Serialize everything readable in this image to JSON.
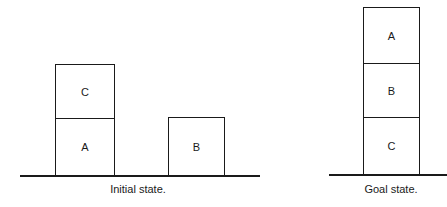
{
  "initial_state": {
    "caption": "Initial state.",
    "blocks": [
      {
        "label": "C",
        "position": "on A"
      },
      {
        "label": "A",
        "position": "on table"
      },
      {
        "label": "B",
        "position": "on table"
      }
    ]
  },
  "goal_state": {
    "caption": "Goal state.",
    "blocks": [
      {
        "label": "A",
        "position": "on B"
      },
      {
        "label": "B",
        "position": "on C"
      },
      {
        "label": "C",
        "position": "on table"
      }
    ]
  }
}
